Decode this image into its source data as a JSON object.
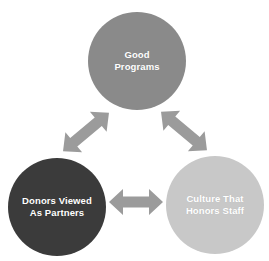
{
  "diagram": {
    "background_color": "#ffffff",
    "arrow_color": "#9b9b9b",
    "label_color": "#ffffff",
    "nodes": [
      {
        "id": "good-programs",
        "label": "Good\nPrograms",
        "line1": "Good",
        "line2": "Programs",
        "color": "#8a8a8a",
        "cx": 137,
        "cy": 61,
        "r": 49,
        "position": "top"
      },
      {
        "id": "donors-viewed-as-partners",
        "label": "Donors Viewed\nAs Partners",
        "line1": "Donors Viewed",
        "line2": "As Partners",
        "color": "#3b3b3b",
        "cx": 57,
        "cy": 207,
        "r": 49,
        "position": "bottom-left"
      },
      {
        "id": "culture-that-honors-staff",
        "label": "Culture That\nHonors Staff",
        "line1": "Culture That",
        "line2": "Honors Staff",
        "color": "#c8c8c8",
        "cx": 215,
        "cy": 205,
        "r": 49,
        "position": "bottom-right"
      }
    ],
    "connectors": [
      {
        "id": "arrow-donors-to-programs",
        "from": "donors-viewed-as-partners",
        "to": "good-programs",
        "style": "double-headed",
        "orientation": "diagonal-up-right"
      },
      {
        "id": "arrow-programs-to-culture",
        "from": "good-programs",
        "to": "culture-that-honors-staff",
        "style": "double-headed",
        "orientation": "diagonal-down-right"
      },
      {
        "id": "arrow-donors-to-culture",
        "from": "donors-viewed-as-partners",
        "to": "culture-that-honors-staff",
        "style": "double-headed",
        "orientation": "horizontal"
      }
    ]
  }
}
